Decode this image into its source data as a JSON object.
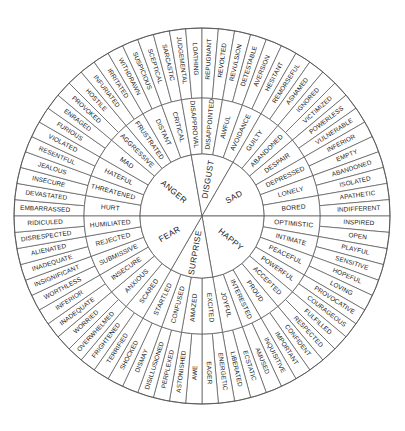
{
  "diagram": {
    "type": "radial-hierarchy",
    "ring_count": 3,
    "center": {
      "x": 202,
      "y": 216
    },
    "radii": {
      "core": 62,
      "mid": 118,
      "outer": 188
    },
    "start_angle_deg": -90,
    "colors": {
      "background": "#ffffff",
      "stroke": "#555555",
      "text": "#1a1a1a"
    }
  },
  "core_emotions": [
    {
      "name": "ANGER",
      "secondary": [
        {
          "name": "HURT",
          "tertiary": [
            "EMBARRASSED",
            "DEVASTATED"
          ]
        },
        {
          "name": "THREATENED",
          "tertiary": [
            "INSECURE",
            "JEALOUS"
          ]
        },
        {
          "name": "HATEFUL",
          "tertiary": [
            "RESENTFUL",
            "VIOLATED"
          ]
        },
        {
          "name": "MAD",
          "tertiary": [
            "FURIOUS",
            "ENRAGED"
          ]
        },
        {
          "name": "AGGRESSIVE",
          "tertiary": [
            "PROVOKED",
            "HOSTILE"
          ]
        },
        {
          "name": "FRUSTRATED",
          "tertiary": [
            "INFURIATED",
            "IRRITATED"
          ]
        },
        {
          "name": "DISTANT",
          "tertiary": [
            "WITHDRAWN",
            "SUSPICIOUS"
          ]
        },
        {
          "name": "CRITICAL",
          "tertiary": [
            "SCEPTICAL",
            "SARCASTIC"
          ]
        }
      ]
    },
    {
      "name": "DISGUST",
      "secondary": [
        {
          "name": "DISAPPROVAL",
          "tertiary": [
            "JUDGEMENTAL",
            "LOATHING"
          ]
        },
        {
          "name": "DISAPPOINTED",
          "tertiary": [
            "REPUGNANT",
            "REVOLTED"
          ]
        },
        {
          "name": "AWFUL",
          "tertiary": [
            "REVULSION",
            "DETESTABLE"
          ]
        },
        {
          "name": "AVOIDANCE",
          "tertiary": [
            "AVERSION",
            "HESITANT"
          ]
        }
      ]
    },
    {
      "name": "SAD",
      "secondary": [
        {
          "name": "GUILTY",
          "tertiary": [
            "REMORSEFUL",
            "ASHAMED"
          ]
        },
        {
          "name": "ABANDONED",
          "tertiary": [
            "IGNORED",
            "VICTIMIZED"
          ]
        },
        {
          "name": "DESPAIR",
          "tertiary": [
            "POWERLESS",
            "VULNERABLE"
          ]
        },
        {
          "name": "DEPRESSED",
          "tertiary": [
            "INFERIOR",
            "EMPTY"
          ]
        },
        {
          "name": "LONELY",
          "tertiary": [
            "ABANDONED",
            "ISOLATED"
          ]
        },
        {
          "name": "BORED",
          "tertiary": [
            "APATHETIC",
            "INDIFFERENT"
          ]
        }
      ]
    },
    {
      "name": "HAPPY",
      "secondary": [
        {
          "name": "OPTIMISTIC",
          "tertiary": [
            "INSPIRED",
            "OPEN"
          ]
        },
        {
          "name": "INTIMATE",
          "tertiary": [
            "PLAYFUL",
            "SENSITIVE"
          ]
        },
        {
          "name": "PEACEFUL",
          "tertiary": [
            "HOPEFUL",
            "LOVING"
          ]
        },
        {
          "name": "POWERFUL",
          "tertiary": [
            "PROVOCATIVE",
            "COURAGEOUS"
          ]
        },
        {
          "name": "ACCEPTED",
          "tertiary": [
            "FULFILLED",
            "RESPECTED"
          ]
        },
        {
          "name": "PROUD",
          "tertiary": [
            "CONFIDENT",
            "IMPORTANT"
          ]
        },
        {
          "name": "INTERESTED",
          "tertiary": [
            "INQUISITIVE",
            "AMUSED"
          ]
        },
        {
          "name": "JOYFUL",
          "tertiary": [
            "ECSTATIC",
            "LIBERATED"
          ]
        }
      ]
    },
    {
      "name": "SURPRISE",
      "secondary": [
        {
          "name": "EXCITED",
          "tertiary": [
            "ENERGETIC",
            "EAGER"
          ]
        },
        {
          "name": "AMAZED",
          "tertiary": [
            "AWE",
            "ASTONISHED"
          ]
        },
        {
          "name": "CONFUSED",
          "tertiary": [
            "PERPLEXED",
            "DISILLUSIONED"
          ]
        },
        {
          "name": "STARTLED",
          "tertiary": [
            "DISMAY",
            "SHOCKED"
          ]
        }
      ]
    },
    {
      "name": "FEAR",
      "secondary": [
        {
          "name": "SCARED",
          "tertiary": [
            "TERRIFIED",
            "FRIGHTENED"
          ]
        },
        {
          "name": "ANXIOUS",
          "tertiary": [
            "OVERWHELMED",
            "WORRIED"
          ]
        },
        {
          "name": "INSECURE",
          "tertiary": [
            "INADEQUATE",
            "INFERIOR"
          ]
        },
        {
          "name": "SUBMISSIVE",
          "tertiary": [
            "WORTHLESS",
            "INSIGNIFICANT"
          ]
        },
        {
          "name": "REJECTED",
          "tertiary": [
            "INADEQUATE",
            "ALIENATED"
          ]
        },
        {
          "name": "HUMILIATED",
          "tertiary": [
            "DISRESPECTED",
            "RIDICULED"
          ]
        }
      ]
    }
  ]
}
